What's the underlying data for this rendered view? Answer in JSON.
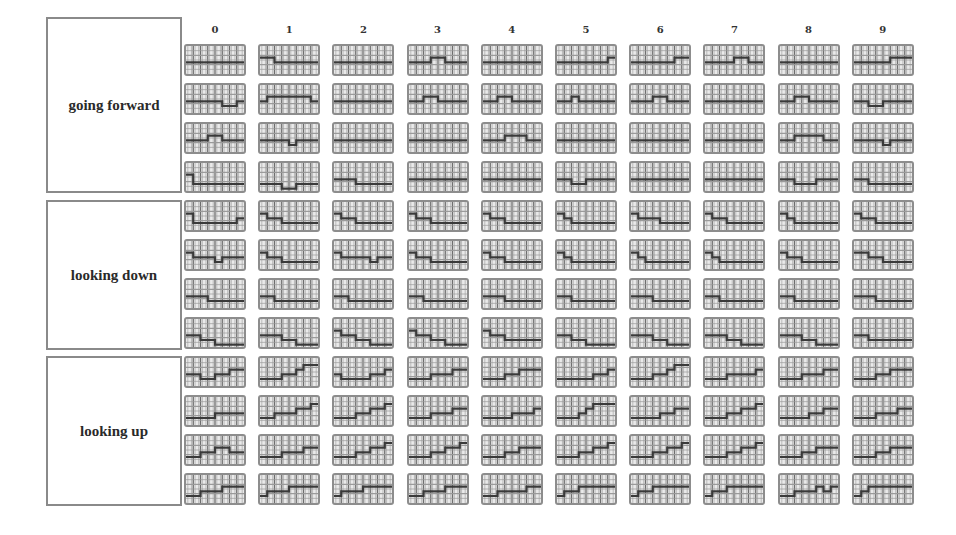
{
  "figure": {
    "column_headers": [
      "0",
      "1",
      "2",
      "3",
      "4",
      "5",
      "6",
      "7",
      "8",
      "9"
    ],
    "groups": [
      {
        "label": "going forward",
        "rows": 4
      },
      {
        "label": "looking down",
        "rows": 4
      },
      {
        "label": "looking up",
        "rows": 4
      }
    ],
    "colors": {
      "cell_bg": "#eaeaea",
      "grid_line": "#9a9a9a",
      "step_line": "#3a3a3a",
      "border": "#8d8d8d"
    }
  },
  "chart_data": {
    "type": "heatmap",
    "title": "",
    "columns": [
      "0",
      "1",
      "2",
      "3",
      "4",
      "5",
      "6",
      "7",
      "8",
      "9"
    ],
    "row_groups": [
      "going forward",
      "looking down",
      "looking up"
    ],
    "cells": [
      [
        [
          3,
          3,
          3,
          3,
          3,
          3,
          3,
          3
        ],
        [
          2,
          2,
          3,
          3,
          3,
          3,
          3,
          3
        ],
        [
          3,
          3,
          3,
          3,
          3,
          3,
          3,
          3
        ],
        [
          3,
          3,
          3,
          2,
          2,
          3,
          3,
          3
        ],
        [
          3,
          3,
          3,
          3,
          3,
          3,
          3,
          3
        ],
        [
          3,
          3,
          3,
          3,
          3,
          3,
          3,
          2
        ],
        [
          3,
          3,
          3,
          3,
          3,
          3,
          2,
          2
        ],
        [
          3,
          3,
          3,
          3,
          2,
          2,
          3,
          3
        ],
        [
          3,
          3,
          3,
          3,
          3,
          3,
          3,
          3
        ],
        [
          3,
          3,
          3,
          3,
          3,
          2,
          2,
          2
        ]
      ],
      [
        [
          3,
          3,
          3,
          3,
          3,
          4,
          4,
          3
        ],
        [
          3,
          2,
          2,
          2,
          2,
          2,
          2,
          3
        ],
        [
          3,
          3,
          3,
          3,
          3,
          3,
          3,
          3
        ],
        [
          3,
          3,
          2,
          2,
          3,
          3,
          3,
          3
        ],
        [
          3,
          3,
          2,
          2,
          3,
          3,
          3,
          3
        ],
        [
          3,
          3,
          2,
          3,
          3,
          3,
          3,
          3
        ],
        [
          3,
          3,
          3,
          2,
          2,
          3,
          3,
          3
        ],
        [
          3,
          3,
          3,
          3,
          3,
          3,
          3,
          3
        ],
        [
          3,
          3,
          2,
          2,
          3,
          3,
          3,
          3
        ],
        [
          3,
          3,
          4,
          4,
          3,
          3,
          3,
          3
        ]
      ],
      [
        [
          3,
          3,
          3,
          2,
          2,
          3,
          3,
          3
        ],
        [
          3,
          3,
          3,
          3,
          4,
          3,
          3,
          3
        ],
        [
          3,
          3,
          3,
          3,
          3,
          3,
          3,
          3
        ],
        [
          3,
          3,
          3,
          3,
          3,
          3,
          3,
          3
        ],
        [
          3,
          3,
          3,
          2,
          2,
          2,
          3,
          3
        ],
        [
          3,
          3,
          3,
          3,
          3,
          3,
          3,
          3
        ],
        [
          3,
          3,
          3,
          3,
          3,
          3,
          3,
          3
        ],
        [
          3,
          3,
          3,
          3,
          3,
          3,
          3,
          3
        ],
        [
          3,
          3,
          2,
          2,
          2,
          2,
          3,
          3
        ],
        [
          3,
          3,
          3,
          3,
          4,
          3,
          3,
          3
        ]
      ],
      [
        [
          2,
          4,
          4,
          4,
          4,
          4,
          4,
          4
        ],
        [
          4,
          4,
          4,
          5,
          5,
          4,
          4,
          4
        ],
        [
          3,
          3,
          3,
          4,
          4,
          4,
          4,
          4
        ],
        [
          3,
          3,
          3,
          3,
          3,
          3,
          3,
          3
        ],
        [
          3,
          3,
          3,
          3,
          3,
          3,
          3,
          3
        ],
        [
          3,
          3,
          4,
          4,
          3,
          3,
          3,
          3
        ],
        [
          3,
          3,
          3,
          3,
          3,
          3,
          3,
          3
        ],
        [
          3,
          3,
          3,
          3,
          3,
          3,
          3,
          3
        ],
        [
          3,
          3,
          4,
          4,
          4,
          3,
          3,
          3
        ],
        [
          3,
          3,
          4,
          4,
          4,
          4,
          4,
          4
        ]
      ],
      [
        [
          2,
          4,
          4,
          4,
          4,
          4,
          4,
          3
        ],
        [
          2,
          3,
          3,
          4,
          4,
          4,
          4,
          4
        ],
        [
          2,
          3,
          3,
          4,
          4,
          4,
          4,
          4
        ],
        [
          2,
          3,
          3,
          4,
          4,
          4,
          4,
          4
        ],
        [
          2,
          3,
          3,
          4,
          4,
          4,
          4,
          4
        ],
        [
          2,
          3,
          4,
          4,
          4,
          4,
          4,
          4
        ],
        [
          2,
          3,
          3,
          3,
          4,
          4,
          4,
          4
        ],
        [
          2,
          3,
          3,
          4,
          4,
          4,
          4,
          4
        ],
        [
          2,
          3,
          4,
          4,
          4,
          4,
          4,
          4
        ],
        [
          2,
          3,
          3,
          4,
          4,
          4,
          4,
          4
        ]
      ],
      [
        [
          2,
          3,
          3,
          3,
          4,
          3,
          3,
          3
        ],
        [
          2,
          3,
          3,
          4,
          4,
          4,
          4,
          4
        ],
        [
          2,
          3,
          3,
          3,
          3,
          4,
          3,
          3
        ],
        [
          2,
          3,
          3,
          4,
          4,
          4,
          4,
          4
        ],
        [
          2,
          3,
          3,
          4,
          4,
          4,
          4,
          4
        ],
        [
          2,
          3,
          4,
          4,
          4,
          4,
          4,
          4
        ],
        [
          2,
          3,
          4,
          4,
          4,
          4,
          4,
          4
        ],
        [
          2,
          3,
          4,
          4,
          4,
          4,
          4,
          4
        ],
        [
          2,
          3,
          3,
          4,
          4,
          4,
          4,
          4
        ],
        [
          2,
          2,
          3,
          3,
          4,
          4,
          4,
          4
        ]
      ],
      [
        [
          3,
          3,
          3,
          4,
          4,
          4,
          4,
          4
        ],
        [
          3,
          3,
          4,
          4,
          4,
          4,
          4,
          4
        ],
        [
          3,
          3,
          4,
          4,
          4,
          4,
          4,
          4
        ],
        [
          3,
          3,
          4,
          4,
          4,
          4,
          4,
          4
        ],
        [
          3,
          3,
          3,
          4,
          4,
          4,
          4,
          4
        ],
        [
          3,
          3,
          4,
          4,
          4,
          4,
          4,
          4
        ],
        [
          3,
          3,
          3,
          4,
          4,
          4,
          4,
          4
        ],
        [
          3,
          3,
          4,
          4,
          4,
          4,
          4,
          4
        ],
        [
          3,
          3,
          4,
          4,
          4,
          4,
          4,
          4
        ],
        [
          3,
          3,
          3,
          4,
          4,
          4,
          4,
          4
        ]
      ],
      [
        [
          3,
          3,
          4,
          4,
          5,
          5,
          5,
          5
        ],
        [
          3,
          3,
          3,
          4,
          4,
          5,
          5,
          5
        ],
        [
          2,
          3,
          3,
          4,
          4,
          5,
          5,
          5
        ],
        [
          2,
          3,
          3,
          4,
          4,
          5,
          5,
          5
        ],
        [
          2,
          3,
          3,
          4,
          4,
          4,
          4,
          4
        ],
        [
          3,
          3,
          4,
          4,
          5,
          5,
          5,
          5
        ],
        [
          3,
          3,
          3,
          4,
          4,
          5,
          5,
          5
        ],
        [
          3,
          3,
          3,
          4,
          4,
          5,
          5,
          5
        ],
        [
          3,
          3,
          3,
          4,
          4,
          5,
          5,
          5
        ],
        [
          3,
          3,
          4,
          4,
          4,
          4,
          4,
          4
        ]
      ],
      [
        [
          3,
          3,
          4,
          4,
          3,
          3,
          2,
          2
        ],
        [
          4,
          4,
          4,
          3,
          3,
          2,
          1,
          1
        ],
        [
          3,
          4,
          4,
          4,
          4,
          3,
          3,
          2
        ],
        [
          4,
          4,
          4,
          3,
          3,
          3,
          2,
          2
        ],
        [
          4,
          4,
          4,
          3,
          3,
          2,
          2,
          2
        ],
        [
          4,
          4,
          4,
          4,
          4,
          3,
          3,
          2
        ],
        [
          4,
          4,
          4,
          3,
          3,
          2,
          1,
          1
        ],
        [
          4,
          4,
          4,
          3,
          3,
          3,
          3,
          2
        ],
        [
          4,
          4,
          4,
          3,
          3,
          3,
          2,
          2
        ],
        [
          4,
          4,
          4,
          3,
          3,
          2,
          2,
          2
        ]
      ],
      [
        [
          4,
          4,
          4,
          4,
          3,
          3,
          3,
          3
        ],
        [
          4,
          4,
          3,
          3,
          3,
          2,
          2,
          1
        ],
        [
          4,
          4,
          4,
          3,
          3,
          2,
          2,
          1
        ],
        [
          4,
          4,
          4,
          3,
          3,
          3,
          2,
          2
        ],
        [
          4,
          4,
          4,
          4,
          3,
          3,
          3,
          2
        ],
        [
          4,
          4,
          4,
          3,
          2,
          1,
          1,
          1
        ],
        [
          4,
          4,
          4,
          4,
          3,
          3,
          2,
          2
        ],
        [
          4,
          4,
          4,
          3,
          3,
          2,
          2,
          1
        ],
        [
          4,
          4,
          4,
          4,
          3,
          3,
          2,
          2
        ],
        [
          4,
          4,
          4,
          3,
          3,
          3,
          2,
          2
        ]
      ],
      [
        [
          4,
          4,
          3,
          3,
          2,
          2,
          3,
          3
        ],
        [
          4,
          4,
          4,
          3,
          3,
          3,
          2,
          2
        ],
        [
          4,
          4,
          4,
          3,
          3,
          2,
          2,
          1
        ],
        [
          4,
          4,
          4,
          3,
          3,
          2,
          2,
          1
        ],
        [
          4,
          4,
          4,
          3,
          3,
          2,
          2,
          2
        ],
        [
          4,
          4,
          4,
          3,
          3,
          2,
          2,
          1
        ],
        [
          4,
          4,
          4,
          3,
          3,
          2,
          2,
          1
        ],
        [
          4,
          4,
          4,
          3,
          3,
          2,
          2,
          1
        ],
        [
          4,
          4,
          4,
          3,
          3,
          2,
          2,
          2
        ],
        [
          4,
          4,
          4,
          3,
          3,
          2,
          2,
          2
        ]
      ],
      [
        [
          4,
          4,
          3,
          3,
          3,
          2,
          2,
          2
        ],
        [
          4,
          3,
          3,
          3,
          2,
          2,
          2,
          2
        ],
        [
          4,
          3,
          3,
          3,
          2,
          2,
          2,
          2
        ],
        [
          4,
          4,
          3,
          3,
          3,
          2,
          2,
          2
        ],
        [
          4,
          4,
          3,
          3,
          3,
          3,
          2,
          2
        ],
        [
          4,
          3,
          3,
          2,
          2,
          2,
          2,
          2
        ],
        [
          4,
          3,
          3,
          2,
          2,
          2,
          2,
          2
        ],
        [
          4,
          3,
          3,
          2,
          2,
          2,
          2,
          2
        ],
        [
          4,
          4,
          3,
          3,
          3,
          2,
          3,
          2
        ],
        [
          4,
          3,
          2,
          2,
          2,
          2,
          2,
          2
        ]
      ]
    ],
    "xlabel": "",
    "ylabel": ""
  }
}
